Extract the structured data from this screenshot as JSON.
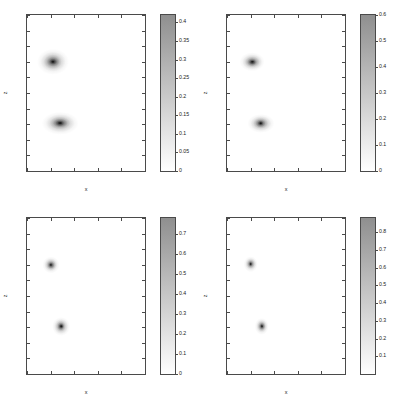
{
  "figure": {
    "layout": "2x2 grid of grayscale intensity maps with vertical colorbars",
    "colormap": "inverted-grayscale",
    "colormap_low_color": "#ffffff",
    "colormap_high_color": "#8f8f8f",
    "peak_color": "#000000"
  },
  "chart_data": [
    {
      "type": "heatmap",
      "title": "",
      "xlabel": "x",
      "ylabel": "z",
      "xlim": [
        0,
        1
      ],
      "ylim": [
        0,
        1
      ],
      "xticks": [
        0,
        0.2,
        0.4,
        0.6,
        0.8,
        1
      ],
      "xticklabels": [
        "0",
        "0.2",
        "0.4",
        "0.6",
        "0.8",
        "1"
      ],
      "yticks": [
        0,
        0.1,
        0.2,
        0.3,
        0.4,
        0.5,
        0.6,
        0.7,
        0.8,
        0.9,
        1
      ],
      "yticklabels": [
        "0",
        "0.1",
        "0.2",
        "0.3",
        "0.4",
        "0.5",
        "0.6",
        "0.7",
        "0.8",
        "0.9",
        "1"
      ],
      "grid": false,
      "colorbar": {
        "vmin": 0,
        "vmax": 0.42,
        "ticks": [
          0,
          0.05,
          0.1,
          0.15,
          0.2,
          0.25,
          0.3,
          0.35,
          0.4
        ],
        "ticklabels": [
          "0",
          "0.05",
          "0.1",
          "0.15",
          "0.2",
          "0.25",
          "0.3",
          "0.35",
          "0.4"
        ]
      },
      "blobs": [
        {
          "x": 0.22,
          "z": 0.7,
          "peak": 0.42,
          "rx": 0.135,
          "rz": 0.085
        },
        {
          "x": 0.28,
          "z": 0.305,
          "peak": 0.42,
          "rx": 0.155,
          "rz": 0.072
        }
      ]
    },
    {
      "type": "heatmap",
      "title": "",
      "xlabel": "x",
      "ylabel": "z",
      "xlim": [
        0,
        1
      ],
      "ylim": [
        0,
        1
      ],
      "xticks": [
        0,
        0.2,
        0.4,
        0.6,
        0.8,
        1
      ],
      "xticklabels": [
        "0",
        "0.2",
        "0.4",
        "0.6",
        "0.8",
        "1"
      ],
      "yticks": [
        0,
        0.1,
        0.2,
        0.3,
        0.4,
        0.5,
        0.6,
        0.7,
        0.8,
        0.9,
        1
      ],
      "yticklabels": [
        "0",
        "0.1",
        "0.2",
        "0.3",
        "0.4",
        "0.5",
        "0.6",
        "0.7",
        "0.8",
        "0.9",
        "1"
      ],
      "grid": false,
      "colorbar": {
        "vmin": 0,
        "vmax": 0.6,
        "ticks": [
          0,
          0.1,
          0.2,
          0.3,
          0.4,
          0.5,
          0.6
        ],
        "ticklabels": [
          "0",
          "0.1",
          "0.2",
          "0.3",
          "0.4",
          "0.5",
          "0.6"
        ]
      },
      "blobs": [
        {
          "x": 0.215,
          "z": 0.7,
          "peak": 0.6,
          "rx": 0.105,
          "rz": 0.062
        },
        {
          "x": 0.285,
          "z": 0.305,
          "peak": 0.6,
          "rx": 0.115,
          "rz": 0.058
        }
      ]
    },
    {
      "type": "heatmap",
      "title": "",
      "xlabel": "x",
      "ylabel": "z",
      "xlim": [
        0,
        1
      ],
      "ylim": [
        0,
        1
      ],
      "xticks": [
        0,
        0.2,
        0.4,
        0.6,
        0.8,
        1
      ],
      "xticklabels": [
        "0",
        "0.2",
        "0.4",
        "0.6",
        "0.8",
        "1"
      ],
      "yticks": [
        0,
        0.1,
        0.2,
        0.3,
        0.4,
        0.5,
        0.6,
        0.7,
        0.8,
        0.9,
        1
      ],
      "yticklabels": [
        "0",
        "0.1",
        "0.2",
        "0.3",
        "0.4",
        "0.5",
        "0.6",
        "0.7",
        "0.8",
        "0.9",
        "1"
      ],
      "grid": false,
      "colorbar": {
        "vmin": 0,
        "vmax": 0.78,
        "ticks": [
          0,
          0.1,
          0.2,
          0.3,
          0.4,
          0.5,
          0.6,
          0.7
        ],
        "ticklabels": [
          "0",
          "0.1",
          "0.2",
          "0.3",
          "0.4",
          "0.5",
          "0.6",
          "0.7"
        ]
      },
      "blobs": [
        {
          "x": 0.205,
          "z": 0.7,
          "peak": 0.78,
          "rx": 0.072,
          "rz": 0.055
        },
        {
          "x": 0.29,
          "z": 0.305,
          "peak": 0.78,
          "rx": 0.075,
          "rz": 0.058
        }
      ]
    },
    {
      "type": "heatmap",
      "title": "",
      "xlabel": "x",
      "ylabel": "z",
      "xlim": [
        0,
        1
      ],
      "ylim": [
        0,
        1
      ],
      "xticks": [
        0,
        0.2,
        0.4,
        0.6,
        0.8,
        1
      ],
      "xticklabels": [
        "0",
        "0.2",
        "0.4",
        "0.6",
        "0.8",
        "1"
      ],
      "yticks": [
        0,
        0.1,
        0.2,
        0.3,
        0.4,
        0.5,
        0.6,
        0.7,
        0.8,
        0.9,
        1
      ],
      "yticklabels": [
        "0",
        "0.1",
        "0.2",
        "0.3",
        "0.4",
        "0.5",
        "0.6",
        "0.7",
        "0.8",
        "0.9",
        "1"
      ],
      "grid": false,
      "colorbar": {
        "vmin": 0,
        "vmax": 0.88,
        "ticks": [
          0.1,
          0.2,
          0.3,
          0.4,
          0.5,
          0.6,
          0.7,
          0.8
        ],
        "ticklabels": [
          "0.1",
          "0.2",
          "0.3",
          "0.4",
          "0.5",
          "0.6",
          "0.7",
          "0.8"
        ]
      },
      "blobs": [
        {
          "x": 0.2,
          "z": 0.705,
          "peak": 0.88,
          "rx": 0.062,
          "rz": 0.05
        },
        {
          "x": 0.295,
          "z": 0.305,
          "peak": 0.88,
          "rx": 0.062,
          "rz": 0.052
        }
      ]
    }
  ]
}
